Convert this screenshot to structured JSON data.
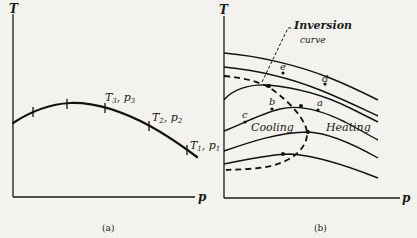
{
  "panel_a": {
    "y_axis_label": "T",
    "x_axis_label": "p",
    "caption": "(a)",
    "points": [
      {
        "label": "T3, p3",
        "t": "T",
        "ts": "3",
        "p": "p",
        "ps": "3"
      },
      {
        "label": "T2, p2",
        "t": "T",
        "ts": "2",
        "p": "p",
        "ps": "2"
      },
      {
        "label": "T1, p1",
        "t": "T",
        "ts": "1",
        "p": "p",
        "ps": "1"
      }
    ]
  },
  "panel_b": {
    "y_axis_label": "T",
    "x_axis_label": "p",
    "caption": "(b)",
    "inversion_label_line1": "Inversion",
    "inversion_label_line2": "curve",
    "region_cooling": "Cooling",
    "region_heating": "Heating",
    "point_labels": {
      "a": "a",
      "b": "b",
      "c": "c",
      "d": "d",
      "e": "e"
    }
  },
  "colors": {
    "background": "#f3f2ee",
    "ink": "#111111"
  }
}
